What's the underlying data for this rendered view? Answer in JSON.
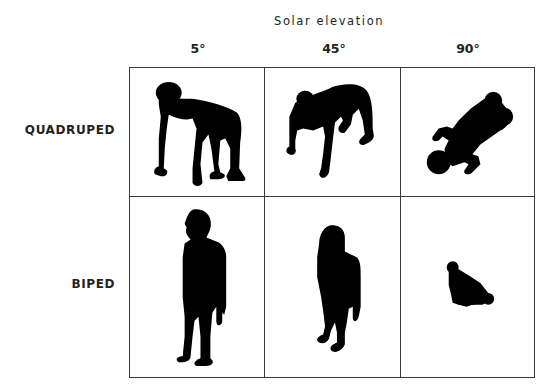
{
  "figure": {
    "axis_title": "Solar elevation",
    "columns": [
      {
        "label": "5°"
      },
      {
        "label": "45°"
      },
      {
        "label": "90°"
      }
    ],
    "rows": [
      {
        "label": "QUADRUPED"
      },
      {
        "label": "BIPED"
      }
    ],
    "cells": [
      {
        "row": "QUADRUPED",
        "column": "5°",
        "icon": "quadruped-shadow-5deg"
      },
      {
        "row": "QUADRUPED",
        "column": "45°",
        "icon": "quadruped-shadow-45deg"
      },
      {
        "row": "QUADRUPED",
        "column": "90°",
        "icon": "quadruped-shadow-90deg"
      },
      {
        "row": "BIPED",
        "column": "5°",
        "icon": "biped-shadow-5deg"
      },
      {
        "row": "BIPED",
        "column": "45°",
        "icon": "biped-shadow-45deg"
      },
      {
        "row": "BIPED",
        "column": "90°",
        "icon": "biped-shadow-90deg"
      }
    ],
    "colors": {
      "silhouette": "#000000",
      "grid_line": "#3a3a3a",
      "background": "#ffffff"
    }
  }
}
